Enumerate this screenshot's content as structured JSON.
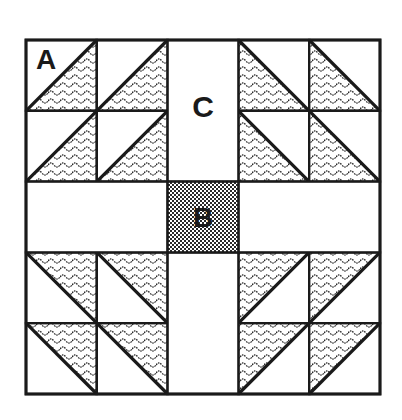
{
  "diagram": {
    "type": "quilt-block",
    "grid": {
      "rows": 5,
      "cols": 5
    },
    "origin": {
      "x": 26,
      "y": 40
    },
    "cell_size": 70.8,
    "colors": {
      "line": "#1a1a1a",
      "background": "#ffffff",
      "pattern_ink": "#2a2a2a"
    },
    "labels": {
      "a": "A",
      "b": "B",
      "c": "C"
    },
    "cells": [
      {
        "row": 0,
        "col": 0,
        "kind": "hst",
        "diagonal": "bl-tr",
        "shaded": "br"
      },
      {
        "row": 0,
        "col": 1,
        "kind": "hst",
        "diagonal": "bl-tr",
        "shaded": "br"
      },
      {
        "row": 0,
        "col": 3,
        "kind": "hst",
        "diagonal": "tl-br",
        "shaded": "bl"
      },
      {
        "row": 0,
        "col": 4,
        "kind": "hst",
        "diagonal": "tl-br",
        "shaded": "bl"
      },
      {
        "row": 1,
        "col": 0,
        "kind": "hst",
        "diagonal": "bl-tr",
        "shaded": "br"
      },
      {
        "row": 1,
        "col": 1,
        "kind": "hst",
        "diagonal": "bl-tr",
        "shaded": "br"
      },
      {
        "row": 1,
        "col": 3,
        "kind": "hst",
        "diagonal": "tl-br",
        "shaded": "bl"
      },
      {
        "row": 1,
        "col": 4,
        "kind": "hst",
        "diagonal": "tl-br",
        "shaded": "bl"
      },
      {
        "row": 3,
        "col": 0,
        "kind": "hst",
        "diagonal": "tl-br",
        "shaded": "tr"
      },
      {
        "row": 3,
        "col": 1,
        "kind": "hst",
        "diagonal": "tl-br",
        "shaded": "tr"
      },
      {
        "row": 3,
        "col": 3,
        "kind": "hst",
        "diagonal": "bl-tr",
        "shaded": "tl"
      },
      {
        "row": 3,
        "col": 4,
        "kind": "hst",
        "diagonal": "bl-tr",
        "shaded": "tl"
      },
      {
        "row": 4,
        "col": 0,
        "kind": "hst",
        "diagonal": "tl-br",
        "shaded": "tr"
      },
      {
        "row": 4,
        "col": 1,
        "kind": "hst",
        "diagonal": "tl-br",
        "shaded": "tr"
      },
      {
        "row": 4,
        "col": 3,
        "kind": "hst",
        "diagonal": "bl-tr",
        "shaded": "tl"
      },
      {
        "row": 4,
        "col": 4,
        "kind": "hst",
        "diagonal": "bl-tr",
        "shaded": "tl"
      }
    ],
    "plain_regions": [
      {
        "name": "sashing-top",
        "row": 0,
        "col": 2,
        "rowspan": 2,
        "colspan": 1,
        "label": "C"
      },
      {
        "name": "sashing-bottom",
        "row": 3,
        "col": 2,
        "rowspan": 2,
        "colspan": 1
      },
      {
        "name": "sashing-left",
        "row": 2,
        "col": 0,
        "rowspan": 1,
        "colspan": 2
      },
      {
        "name": "sashing-right",
        "row": 2,
        "col": 3,
        "rowspan": 1,
        "colspan": 2
      }
    ],
    "center": {
      "row": 2,
      "col": 2,
      "label": "B",
      "pattern": "checker"
    }
  }
}
